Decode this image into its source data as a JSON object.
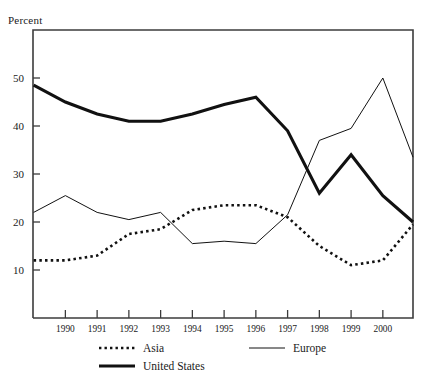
{
  "chart_data": {
    "type": "line",
    "title": "",
    "xlabel": "",
    "ylabel": "Percent",
    "ylim": [
      0,
      60
    ],
    "xlim": [
      1988.98,
      2000.95
    ],
    "grid": false,
    "legend_position": "below-plot",
    "yticks": [
      10,
      20,
      30,
      40,
      50
    ],
    "ytick_labels": [
      "10",
      "20",
      "30",
      "40",
      "50"
    ],
    "xticks": [
      1990,
      1991,
      1992,
      1993,
      1994,
      1995,
      1996,
      1997,
      1998,
      1999,
      2000
    ],
    "xtick_labels": [
      "1990",
      "1991",
      "1992",
      "1993",
      "1994",
      "1995",
      "1996",
      "1997",
      "1998",
      "1999",
      "2000"
    ],
    "x": [
      1989.0,
      1990,
      1991,
      1992,
      1993,
      1994,
      1995,
      1996,
      1997,
      1998,
      1999,
      2000,
      2000.95
    ],
    "series": [
      {
        "name": "Asia",
        "style": "dotted",
        "color": "#111111",
        "width": 2.6,
        "values": [
          12.0,
          12.0,
          13.0,
          17.5,
          18.5,
          22.5,
          23.5,
          23.5,
          21.0,
          15.0,
          11.0,
          12.0,
          19.5
        ]
      },
      {
        "name": "Europe",
        "style": "solid-thin",
        "color": "#111111",
        "width": 1.0,
        "values": [
          22.0,
          25.5,
          22.0,
          20.5,
          22.0,
          15.5,
          16.0,
          15.5,
          21.5,
          37.0,
          39.5,
          50.0,
          33.5
        ]
      },
      {
        "name": "United States",
        "style": "solid-thick",
        "color": "#111111",
        "width": 3.1,
        "values": [
          48.5,
          45.0,
          42.5,
          41.0,
          41.0,
          42.5,
          44.5,
          46.0,
          39.0,
          26.0,
          34.0,
          25.5,
          20.0
        ]
      }
    ]
  },
  "legend": {
    "items": [
      {
        "label": "Asia",
        "style": "dotted"
      },
      {
        "label": "Europe",
        "style": "solid-thin"
      },
      {
        "label": "United States",
        "style": "solid-thick"
      }
    ]
  }
}
